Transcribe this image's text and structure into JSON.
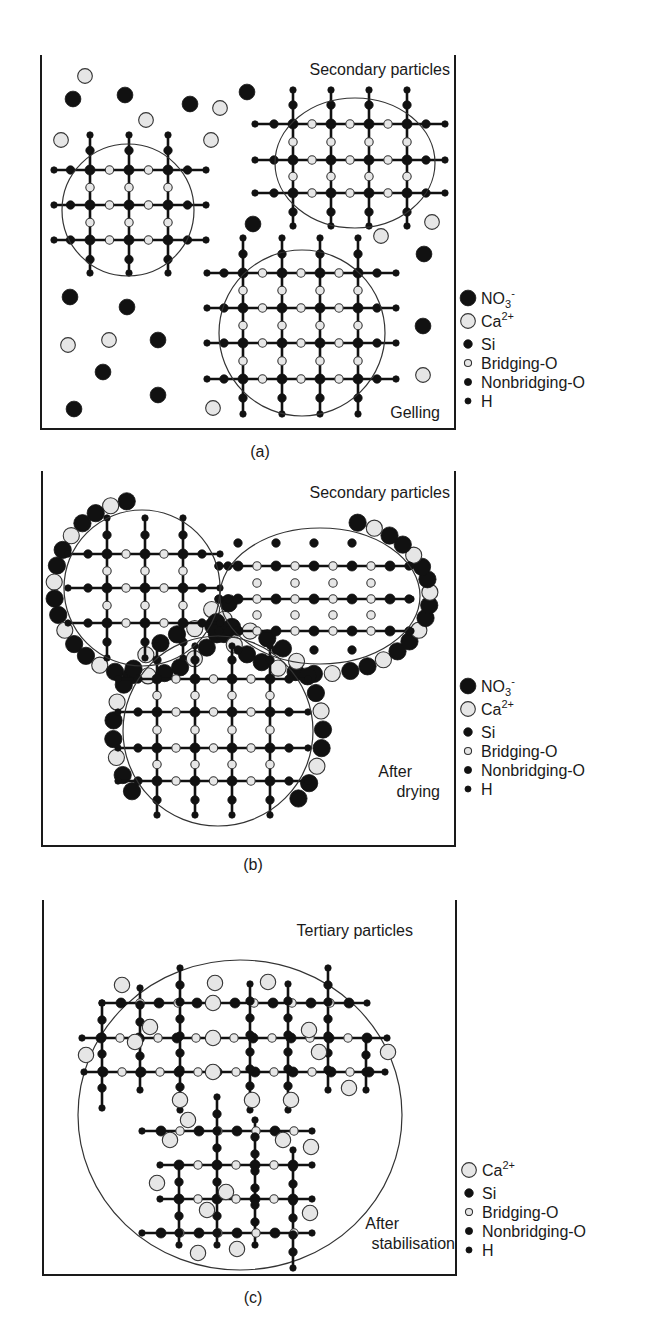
{
  "colors": {
    "ink": "#111111",
    "light_fill": "#e6e6e6",
    "frame": "#1a1a1a",
    "boundary": "#333333"
  },
  "panels": [
    {
      "id": "a",
      "caption": "(a)",
      "title": "Secondary particles",
      "stage_label": [
        "Gelling"
      ],
      "frame": {
        "left": 41,
        "top": 55,
        "right": 455,
        "bottom": 429
      },
      "caption_pos": [
        260,
        457
      ],
      "title_pos": [
        450,
        75
      ],
      "stage_pos": [
        440,
        418
      ],
      "legend_top": 298,
      "legend_items": [
        "NO3-",
        "Ca2+",
        "Si",
        "Bridging-O",
        "Nonbridging-O",
        "H"
      ],
      "boundaries": [
        {
          "type": "ellipse",
          "cx": 128,
          "cy": 210,
          "rx": 66,
          "ry": 66
        },
        {
          "type": "ellipse",
          "cx": 355,
          "cy": 163,
          "rx": 80,
          "ry": 65
        },
        {
          "type": "ellipse",
          "cx": 302,
          "cy": 333,
          "rx": 83,
          "ry": 83
        }
      ],
      "lattices": [
        {
          "xs": [
            90,
            129,
            168
          ],
          "ys": [
            170,
            205,
            240
          ],
          "xmin": 54,
          "xmax": 206,
          "ymin": 135,
          "ymax": 273,
          "step": 19.5
        },
        {
          "xs": [
            293,
            331,
            369,
            407
          ],
          "ys": [
            124,
            160,
            193
          ],
          "xmin": 255,
          "xmax": 445,
          "ymin": 90,
          "ymax": 226,
          "step": 19
        },
        {
          "xs": [
            243,
            282,
            320,
            358
          ],
          "ys": [
            273,
            308,
            343,
            379
          ],
          "xmin": 207,
          "xmax": 396,
          "ymin": 238,
          "ymax": 414,
          "step": 19
        }
      ],
      "free_ions": [
        {
          "k": "ca",
          "x": 85,
          "y": 76
        },
        {
          "k": "no3",
          "x": 73,
          "y": 99
        },
        {
          "k": "no3",
          "x": 125,
          "y": 95
        },
        {
          "k": "no3",
          "x": 190,
          "y": 104
        },
        {
          "k": "ca",
          "x": 220,
          "y": 108
        },
        {
          "k": "no3",
          "x": 247,
          "y": 92
        },
        {
          "k": "ca",
          "x": 146,
          "y": 120
        },
        {
          "k": "ca",
          "x": 61,
          "y": 140
        },
        {
          "k": "ca",
          "x": 211,
          "y": 140
        },
        {
          "k": "no3",
          "x": 253,
          "y": 224
        },
        {
          "k": "ca",
          "x": 432,
          "y": 222
        },
        {
          "k": "ca",
          "x": 381,
          "y": 236
        },
        {
          "k": "no3",
          "x": 424,
          "y": 254
        },
        {
          "k": "no3",
          "x": 70,
          "y": 297
        },
        {
          "k": "no3",
          "x": 127,
          "y": 307
        },
        {
          "k": "ca",
          "x": 68,
          "y": 345
        },
        {
          "k": "ca",
          "x": 109,
          "y": 340
        },
        {
          "k": "no3",
          "x": 158,
          "y": 340
        },
        {
          "k": "no3",
          "x": 103,
          "y": 372
        },
        {
          "k": "no3",
          "x": 158,
          "y": 395
        },
        {
          "k": "no3",
          "x": 74,
          "y": 409
        },
        {
          "k": "ca",
          "x": 213,
          "y": 408
        },
        {
          "k": "no3",
          "x": 423,
          "y": 326
        },
        {
          "k": "ca",
          "x": 423,
          "y": 375
        }
      ]
    },
    {
      "id": "b",
      "caption": "(b)",
      "title": "Secondary particles",
      "stage_label": [
        "After",
        "drying"
      ],
      "frame": {
        "left": 42,
        "top": 471,
        "right": 455,
        "bottom": 846
      },
      "caption_pos": [
        253,
        870
      ],
      "title_pos": [
        450,
        498
      ],
      "stage_pos": [
        440,
        797
      ],
      "legend_top": 686,
      "legend_items": [
        "NO3-",
        "Ca2+",
        "Si",
        "Bridging-O",
        "Nonbridging-O",
        "H"
      ],
      "boundaries": [
        {
          "type": "ellipse",
          "cx": 142,
          "cy": 588,
          "rx": 78,
          "ry": 78
        },
        {
          "type": "ellipse",
          "cx": 320,
          "cy": 596,
          "rx": 100,
          "ry": 68
        },
        {
          "type": "ellipse",
          "cx": 218,
          "cy": 731,
          "rx": 95,
          "ry": 95
        }
      ],
      "lattices": [
        {
          "xs": [
            107,
            145,
            183
          ],
          "ys": [
            554,
            588,
            623
          ],
          "xmin": 68,
          "xmax": 220,
          "ymin": 518,
          "ymax": 658,
          "step": 19
        },
        {
          "xs": [
            238,
            276,
            314,
            352,
            390
          ],
          "ys": [
            566,
            599,
            631
          ],
          "xmin": 218,
          "xmax": 411,
          "ymin": 0,
          "ymax": 0,
          "step": 19,
          "horizontal_only": true
        },
        {
          "xs": [
            157,
            195,
            232,
            270
          ],
          "ys": [
            679,
            712,
            748,
            781
          ],
          "xmin": 118,
          "xmax": 308,
          "ymin": 646,
          "ymax": 815,
          "step": 19
        }
      ],
      "dots_only": [
        {
          "k": "nbo",
          "x": 238,
          "y": 543
        },
        {
          "k": "nbo",
          "x": 276,
          "y": 543
        },
        {
          "k": "nbo",
          "x": 314,
          "y": 543
        },
        {
          "k": "nbo",
          "x": 352,
          "y": 543
        },
        {
          "k": "bo",
          "x": 257,
          "y": 583
        },
        {
          "k": "bo",
          "x": 295,
          "y": 583
        },
        {
          "k": "bo",
          "x": 333,
          "y": 583
        },
        {
          "k": "bo",
          "x": 371,
          "y": 583
        },
        {
          "k": "bo",
          "x": 257,
          "y": 615
        },
        {
          "k": "bo",
          "x": 295,
          "y": 615
        },
        {
          "k": "bo",
          "x": 333,
          "y": 615
        },
        {
          "k": "bo",
          "x": 371,
          "y": 615
        },
        {
          "k": "nbo",
          "x": 238,
          "y": 650
        },
        {
          "k": "nbo",
          "x": 276,
          "y": 650
        },
        {
          "k": "nbo",
          "x": 314,
          "y": 650
        },
        {
          "k": "nbo",
          "x": 352,
          "y": 650
        }
      ],
      "shell": [
        {
          "cx": 142,
          "cy": 588,
          "r": 88,
          "from": 100,
          "to": 350,
          "n": 24
        },
        {
          "cx": 320,
          "cy": 596,
          "rx": 110,
          "ry": 78,
          "from": 190,
          "to": 430,
          "n": 26
        },
        {
          "cx": 218,
          "cy": 731,
          "r": 105,
          "from": -40,
          "to": 215,
          "n": 26
        }
      ]
    },
    {
      "id": "c",
      "caption": "(c)",
      "title": "Tertiary particles",
      "stage_label": [
        "After",
        "stabilisation"
      ],
      "frame": {
        "left": 43,
        "top": 900,
        "right": 456,
        "bottom": 1275
      },
      "caption_pos": [
        253,
        1303
      ],
      "title_pos": [
        413,
        936
      ],
      "stage_pos": [
        455,
        1249
      ],
      "legend_top": 1170,
      "legend_items": [
        "Ca2+",
        "Si",
        "Bridging-O",
        "Nonbridging-O",
        "H"
      ],
      "boundaries": [
        {
          "type": "ellipse",
          "cx": 240,
          "cy": 1115,
          "rx": 162,
          "ry": 155
        }
      ],
      "rows": [
        {
          "y": 1003,
          "x1": 102,
          "x2": 367
        },
        {
          "y": 1038,
          "x1": 82,
          "x2": 387
        },
        {
          "y": 1072,
          "x1": 84,
          "x2": 385
        },
        {
          "y": 1131,
          "x1": 142,
          "x2": 312
        },
        {
          "y": 1165,
          "x1": 160,
          "x2": 312
        },
        {
          "y": 1199,
          "x1": 160,
          "x2": 312
        },
        {
          "y": 1233,
          "x1": 142,
          "x2": 312
        }
      ],
      "cols": [
        {
          "x": 102,
          "y1": 1003,
          "y2": 1108
        },
        {
          "x": 140,
          "y1": 988,
          "y2": 1090
        },
        {
          "x": 180,
          "y1": 968,
          "y2": 1110
        },
        {
          "x": 250,
          "y1": 984,
          "y2": 1110
        },
        {
          "x": 288,
          "y1": 984,
          "y2": 1110
        },
        {
          "x": 328,
          "y1": 968,
          "y2": 1090
        },
        {
          "x": 366,
          "y1": 1038,
          "y2": 1090
        },
        {
          "x": 217,
          "y1": 1097,
          "y2": 1245
        },
        {
          "x": 255,
          "y1": 1120,
          "y2": 1245
        },
        {
          "x": 179,
          "y1": 1165,
          "y2": 1245
        },
        {
          "x": 293,
          "y1": 1150,
          "y2": 1268
        }
      ],
      "ca": [
        {
          "x": 122,
          "y": 985
        },
        {
          "x": 215,
          "y": 983
        },
        {
          "x": 268,
          "y": 982
        },
        {
          "x": 213,
          "y": 1003
        },
        {
          "x": 150,
          "y": 1027
        },
        {
          "x": 135,
          "y": 1042
        },
        {
          "x": 86,
          "y": 1055
        },
        {
          "x": 213,
          "y": 1038
        },
        {
          "x": 309,
          "y": 1030
        },
        {
          "x": 319,
          "y": 1052
        },
        {
          "x": 388,
          "y": 1052
        },
        {
          "x": 213,
          "y": 1072
        },
        {
          "x": 349,
          "y": 1088
        },
        {
          "x": 180,
          "y": 1100
        },
        {
          "x": 252,
          "y": 1100
        },
        {
          "x": 291,
          "y": 1100
        },
        {
          "x": 188,
          "y": 1120
        },
        {
          "x": 170,
          "y": 1140
        },
        {
          "x": 283,
          "y": 1140
        },
        {
          "x": 311,
          "y": 1147
        },
        {
          "x": 157,
          "y": 1183
        },
        {
          "x": 226,
          "y": 1192
        },
        {
          "x": 207,
          "y": 1210
        },
        {
          "x": 310,
          "y": 1213
        },
        {
          "x": 198,
          "y": 1253
        },
        {
          "x": 237,
          "y": 1249
        }
      ]
    }
  ],
  "legend_symbols": {
    "NO3-": {
      "label_main": "NO",
      "sub": "3",
      "sup": "-",
      "symbol": "no3"
    },
    "Ca2+": {
      "label_main": "Ca",
      "sub": "",
      "sup": "2+",
      "symbol": "ca"
    },
    "Si": {
      "label_main": "Si",
      "sub": "",
      "sup": "",
      "symbol": "si"
    },
    "Bridging-O": {
      "label_main": "Bridging-O",
      "sub": "",
      "sup": "",
      "symbol": "bo"
    },
    "Nonbridging-O": {
      "label_main": "Nonbridging-O",
      "sub": "",
      "sup": "",
      "symbol": "nbo"
    },
    "H": {
      "label_main": "H",
      "sub": "",
      "sup": "",
      "symbol": "h"
    }
  }
}
